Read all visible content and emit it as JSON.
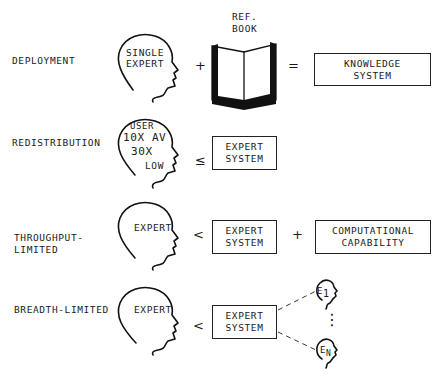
{
  "rows": [
    {
      "label": "DEPLOYMENT",
      "head_text": [
        "SINGLE",
        "EXPERT"
      ],
      "op1": "+",
      "book_label": [
        "REF.",
        "BOOK"
      ],
      "op2": "=",
      "result_box": [
        "KNOWLEDGE",
        "SYSTEM"
      ]
    },
    {
      "label": "REDISTRIBUTION",
      "head_text": [
        "USER",
        "10X AV",
        "30X",
        "LOW"
      ],
      "op1": "≤",
      "box": [
        "EXPERT",
        "SYSTEM"
      ]
    },
    {
      "label": [
        "THROUGHPUT-",
        "LIMITED"
      ],
      "head_text": [
        "EXPERT"
      ],
      "op1": "<",
      "box": [
        "EXPERT",
        "SYSTEM"
      ],
      "op2": "+",
      "box2": [
        "COMPUTATIONAL",
        "CAPABILITY"
      ]
    },
    {
      "label": "BREADTH-LIMITED",
      "head_text": [
        "EXPERT"
      ],
      "op1": "<",
      "box": [
        "EXPERT",
        "SYSTEM"
      ],
      "small_heads": [
        {
          "letter": "E",
          "sub": "1"
        },
        {
          "letter": "E",
          "sub": "N"
        }
      ],
      "ellipsis": "⋮"
    }
  ]
}
